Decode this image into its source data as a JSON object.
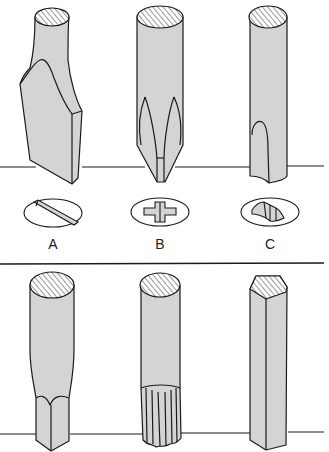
{
  "figure": {
    "colors": {
      "fill": "#d4d4d4",
      "stroke": "#1a1a1a",
      "background": "#ffffff"
    },
    "top_row": {
      "tips": [
        {
          "id": "slotted",
          "label": "A",
          "screw_head": "slot"
        },
        {
          "id": "phillips",
          "label": "B",
          "screw_head": "cross"
        },
        {
          "id": "clutch",
          "label": "C",
          "screw_head": "bow-tie"
        }
      ]
    },
    "bottom_row": {
      "tips": [
        {
          "id": "square"
        },
        {
          "id": "torx"
        },
        {
          "id": "hex"
        }
      ]
    }
  }
}
